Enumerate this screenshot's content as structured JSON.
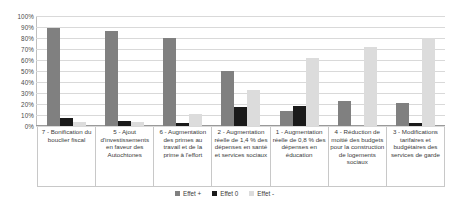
{
  "chart_data": {
    "type": "bar",
    "title": "",
    "subtitle": "",
    "xlabel": "",
    "ylabel": "",
    "ylim": [
      0,
      100
    ],
    "grid": true,
    "legend_position": "bottom",
    "y_ticks": [
      "0%",
      "10%",
      "20%",
      "30%",
      "40%",
      "50%",
      "60%",
      "70%",
      "80%",
      "90%",
      "100%"
    ],
    "y_tick_values": [
      0,
      10,
      20,
      30,
      40,
      50,
      60,
      70,
      80,
      90,
      100
    ],
    "categories": [
      "7 - Bonification du bouclier fiscal",
      "5 - Ajout d'investissements en faveur des Autochtones",
      "6 - Augmentation des primes au travail et de la prime à l'effort",
      "2 - Augmentation réelle de 1,4 % des dépenses en santé et services sociaux",
      "1 - Augmentation réelle de 0,8 % des dépenses en éducation",
      "4 - Réduction de moitié des budgets pour la construction de logements sociaux",
      "3 - Modifications tarifaires et budgétaires des services de garde"
    ],
    "series": [
      {
        "name": "Effet +",
        "color": "#808080",
        "values": [
          89,
          86,
          80,
          50,
          14,
          23,
          21
        ]
      },
      {
        "name": "Effet 0",
        "color": "#1a1a1a",
        "values": [
          7,
          5,
          3,
          17,
          18,
          0,
          3
        ]
      },
      {
        "name": "Effet -",
        "color": "#dcdcdc",
        "values": [
          4,
          4,
          11,
          33,
          62,
          72,
          80
        ]
      }
    ]
  }
}
